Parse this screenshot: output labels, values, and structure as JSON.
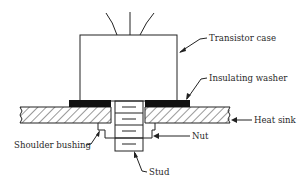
{
  "figure": {
    "type": "cross-section diagram"
  },
  "labels": {
    "transistor_case": "Transistor case",
    "insulating_washer": "Insulating washer",
    "heat_sink": "Heat sink",
    "nut": "Nut",
    "shoulder_bushing": "Shoulder bushing",
    "stud": "Stud"
  },
  "colors": {
    "line": "#222222",
    "washer_fill": "#111111",
    "text": "#2a2a2a",
    "background": "#ffffff"
  }
}
